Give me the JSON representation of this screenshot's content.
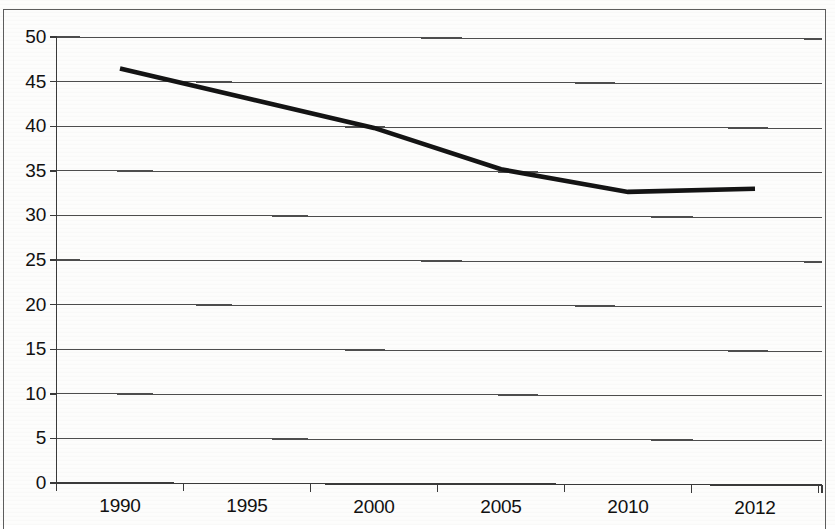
{
  "chart_data": {
    "type": "line",
    "title": "",
    "subtitle": "",
    "xlabel": "",
    "ylabel": "",
    "categories": [
      "1990",
      "1995",
      "2000",
      "2005",
      "2010",
      "2012"
    ],
    "series": [
      {
        "name": "series-1",
        "values": [
          46.5,
          43.2,
          39.9,
          35.3,
          32.8,
          33.2
        ]
      }
    ],
    "ylim": [
      0,
      50
    ],
    "yticks": [
      0,
      5,
      10,
      15,
      20,
      25,
      30,
      35,
      40,
      45,
      50
    ],
    "ytick_labels": [
      "0",
      "5",
      "10",
      "15",
      "20",
      "25",
      "30",
      "35",
      "40",
      "45",
      "50"
    ],
    "xtick_labels": [
      "1990",
      "1995",
      "2000",
      "2005",
      "2010",
      "2012"
    ],
    "grid": "horizontal",
    "legend": "none",
    "annotations": [],
    "line_color": "#141414",
    "grid_color": "#4d4d4d",
    "axis_color": "#3a3a3a",
    "background_color": "#fdfdfc"
  }
}
